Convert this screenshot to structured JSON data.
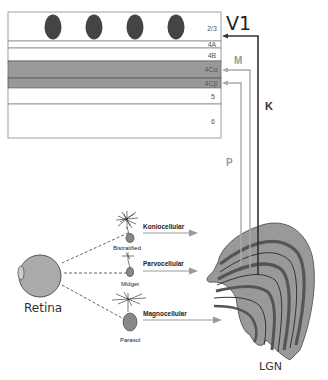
{
  "v1": {
    "title": "V1",
    "layers": [
      {
        "label": "2/3",
        "y": 12,
        "h": 29,
        "fill": "#ffffff"
      },
      {
        "label": "4A",
        "y": 41,
        "h": 7,
        "fill": "#ffffff"
      },
      {
        "label": "4B",
        "y": 48,
        "h": 13,
        "fill": "#ffffff"
      },
      {
        "label": "4Cα",
        "y": 61,
        "h": 17,
        "fill": "#999999"
      },
      {
        "label": "4Cβ",
        "y": 78,
        "h": 10,
        "fill": "#999999"
      },
      {
        "label": "5",
        "y": 88,
        "h": 16,
        "fill": "#ffffff"
      },
      {
        "label": "6",
        "y": 104,
        "h": 34,
        "fill": "#ffffff"
      }
    ],
    "blobs": 4
  },
  "pathways": {
    "K": {
      "label": "K",
      "color": "#333333",
      "target_layer": "2/3"
    },
    "M": {
      "label": "M",
      "color": "#999999",
      "target_layer": "4Cα"
    },
    "P": {
      "label": "P",
      "color": "#999999",
      "target_layer": "4Cβ"
    }
  },
  "retina": {
    "label": "Retina"
  },
  "cells": [
    {
      "name": "Bistratified",
      "pathway": "Koniocellular"
    },
    {
      "name": "Midget",
      "pathway": "Parvocellular"
    },
    {
      "name": "Parasol",
      "pathway": "Magnocellular"
    }
  ],
  "lgn": {
    "label": "LGN"
  },
  "colors": {
    "dark_gray": "#555555",
    "mid_gray": "#999999",
    "light_gray": "#aaaaaa",
    "line_dark": "#333333"
  }
}
